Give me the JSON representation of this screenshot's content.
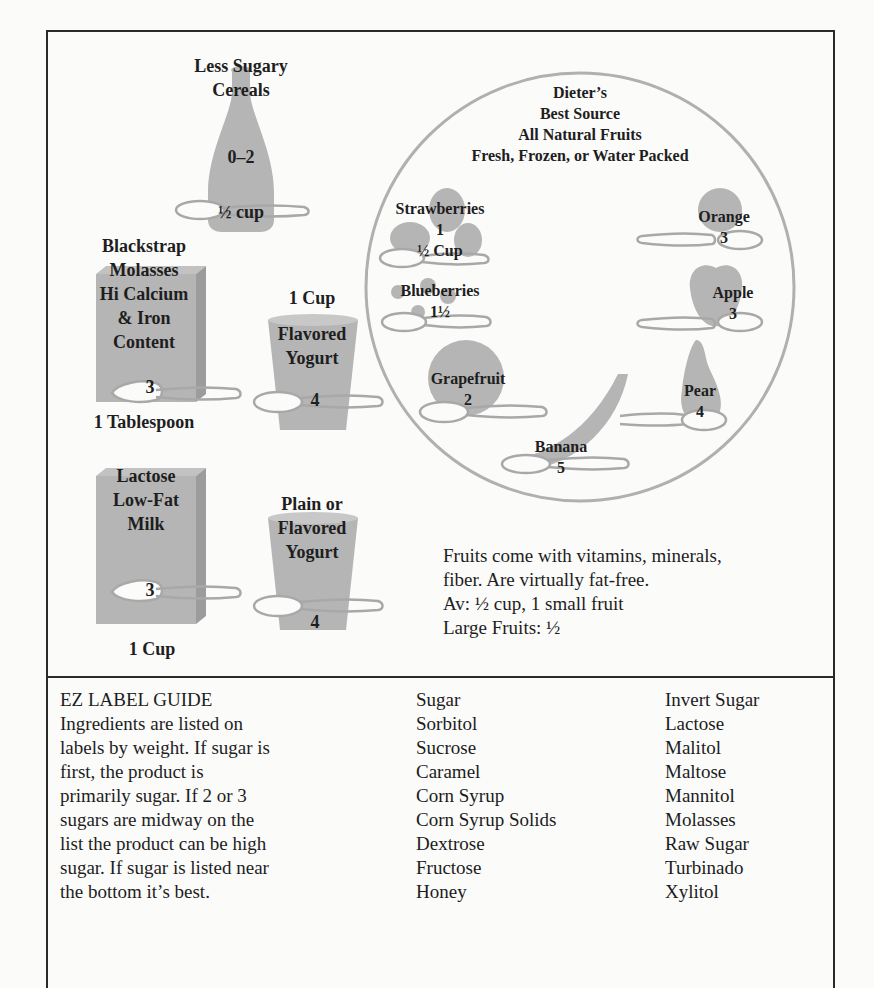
{
  "upper_panel": {
    "cereal": {
      "title_line1": "Less Sugary",
      "title_line2": "Cereals",
      "value": "0–2",
      "serving": "½ cup"
    },
    "molasses": {
      "lines": [
        "Blackstrap",
        "Molasses",
        "Hi Calcium",
        "& Iron",
        "Content"
      ],
      "value": "3",
      "serving": "1 Tablespoon"
    },
    "flavored_yogurt": {
      "serving": "1 Cup",
      "title_line1": "Flavored",
      "title_line2": "Yogurt",
      "value": "4"
    },
    "milk": {
      "lines": [
        "Lactose",
        "Low-Fat",
        "Milk"
      ],
      "value": "3",
      "serving": "1 Cup"
    },
    "plain_yogurt": {
      "title_line1": "Plain or",
      "title_line2": "Flavored",
      "title_line3": "Yogurt",
      "value": "4"
    },
    "fruit_circle": {
      "heading": [
        "Dieter’s",
        "Best Source",
        "All Natural Fruits",
        "Fresh, Frozen, or Water Packed"
      ],
      "fruits": [
        {
          "name": "Strawberries",
          "value": "1",
          "serving": "½ Cup"
        },
        {
          "name": "Blueberries",
          "value": "1½"
        },
        {
          "name": "Grapefruit",
          "value": "2"
        },
        {
          "name": "Banana",
          "value": "5"
        },
        {
          "name": "Pear",
          "value": "4"
        },
        {
          "name": "Apple",
          "value": "3"
        },
        {
          "name": "Orange",
          "value": "3"
        }
      ]
    },
    "fruit_note": {
      "line1": "Fruits come with vitamins, minerals,",
      "line2": "fiber. Are virtually fat-free.",
      "line3": "Av: ½ cup, 1 small fruit",
      "line4": "Large Fruits: ½"
    }
  },
  "label_guide": {
    "title": "EZ LABEL GUIDE",
    "lines": [
      "Ingredients are listed on",
      "labels by weight. If sugar is",
      "first, the product is",
      "primarily sugar. If 2 or 3",
      "sugars are midway on the",
      "list the product can be high",
      "sugar. If sugar is listed near",
      "the bottom it’s best."
    ],
    "sugars_col1": [
      "Sugar",
      "Sorbitol",
      "Sucrose",
      "Caramel",
      "Corn Syrup",
      "Corn Syrup Solids",
      "Dextrose",
      "Fructose",
      "Honey"
    ],
    "sugars_col2": [
      "Invert Sugar",
      "Lactose",
      "Malitol",
      "Maltose",
      "Mannitol",
      "Molasses",
      "Raw Sugar",
      "Turbinado",
      "Xylitol"
    ]
  },
  "colors": {
    "illustration_gray": "#b3b3b3",
    "line_gray": "#a8a8a8",
    "border": "#2a2a2a",
    "text": "#1e1e1e"
  }
}
